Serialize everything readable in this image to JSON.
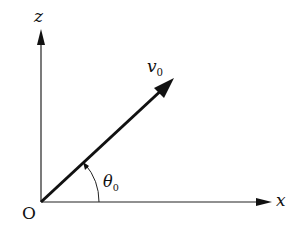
{
  "diagram": {
    "type": "projectile launch vector",
    "axes": {
      "vertical": "z",
      "horizontal": "x",
      "origin": "O"
    },
    "vector": {
      "symbol": "v",
      "subscript": "0"
    },
    "angle": {
      "symbol": "θ",
      "subscript": "0"
    },
    "colors": {
      "line": "#111111",
      "background": "#ffffff"
    }
  }
}
